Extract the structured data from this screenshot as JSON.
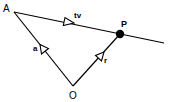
{
  "diagram": {
    "type": "vector-geometry",
    "colors": {
      "stroke": "#000000",
      "background": "#ffffff",
      "point_fill": "#000000"
    },
    "points": {
      "A": {
        "label": "A",
        "x": 14,
        "y": 12
      },
      "P": {
        "label": "P",
        "x": 120,
        "y": 34
      },
      "O": {
        "label": "O",
        "x": 73,
        "y": 86
      },
      "line_end": {
        "x": 164,
        "y": 43
      }
    },
    "vectors": [
      {
        "id": "a",
        "label": "a",
        "from": "O",
        "to": "A"
      },
      {
        "id": "r",
        "label": "r",
        "from": "O",
        "to": "P"
      },
      {
        "id": "tv",
        "label": "tv",
        "from": "A",
        "to": "P"
      }
    ]
  }
}
